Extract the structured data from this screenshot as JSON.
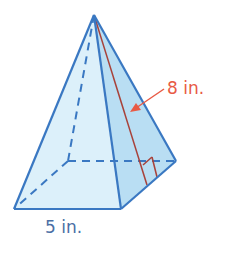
{
  "figure": {
    "type": "square pyramid",
    "labels": {
      "slant_height": "8 in.",
      "base_edge": "5 in."
    },
    "colors": {
      "edge": "#3a78c2",
      "face_light": "#d9eef9",
      "face_dark": "#b5dcf2",
      "slant_line": "#a8423a",
      "slant_label": "#e85a45",
      "base_label": "#4a6fa5"
    },
    "vertices": {
      "apex": [
        94,
        15
      ],
      "front_left": [
        14,
        209
      ],
      "front_right": [
        121,
        209
      ],
      "back_right": [
        176,
        161
      ],
      "back_left": [
        68,
        161
      ]
    }
  }
}
